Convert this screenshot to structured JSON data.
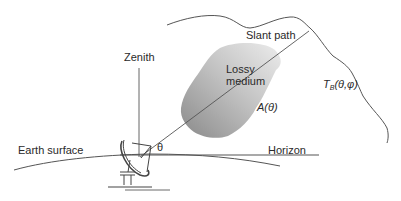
{
  "diagram": {
    "labels": {
      "zenith": "Zenith",
      "slant_path": "Slant path",
      "lossy_medium_line1": "Lossy",
      "lossy_medium_line2": "medium",
      "attenuation": "A(θ)",
      "brightness_T": "T",
      "brightness_sub": "B",
      "brightness_args": "(θ,φ)",
      "theta": "θ",
      "earth_surface": "Earth surface",
      "horizon": "Horizon"
    },
    "colors": {
      "line": "#555555",
      "medium_dark": "#8a8a8a",
      "medium_light": "#e6e6e6",
      "text": "#2a2a2a"
    }
  }
}
